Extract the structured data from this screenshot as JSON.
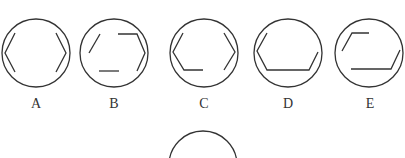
{
  "puzzle": {
    "stroke_color": "#333333",
    "options": [
      {
        "label": "A",
        "cx": 36,
        "cy": 53
      },
      {
        "label": "B",
        "cx": 114,
        "cy": 53
      },
      {
        "label": "C",
        "cx": 204,
        "cy": 53
      },
      {
        "label": "D",
        "cx": 288,
        "cy": 53
      },
      {
        "label": "E",
        "cx": 369,
        "cy": 53
      }
    ],
    "question_circle": {
      "cx": 203,
      "cy": 165
    }
  }
}
